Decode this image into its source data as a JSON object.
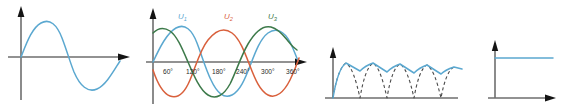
{
  "figure": {
    "background_color": "#ffffff",
    "axis_color": "#6e6e6e",
    "arrow_color": "#141414",
    "panel_count": 4
  },
  "palette": {
    "blue": "#5ba8d0",
    "red": "#d9603c",
    "green": "#3d7a4a",
    "dashed_gray": "#4a4a4a"
  },
  "panels": [
    {
      "id": "panel-ac-sine",
      "name": "single-phase-ac-sine",
      "description": "Single sinusoid, one full cycle, positive half then negative half",
      "axes": {
        "x_axis": true,
        "y_axis": true,
        "x_arrow": true,
        "y_arrow": true
      },
      "series": [
        {
          "name": "u",
          "color": "#5ba8d0",
          "style": "solid",
          "cycles": 1,
          "amplitude": 1.0
        }
      ],
      "tick_labels": []
    },
    {
      "id": "panel-three-phase",
      "name": "three-phase-ac-sines",
      "description": "Three sinusoids phase shifted by 120 degrees with degree axis labels",
      "axes": {
        "x_axis": true,
        "y_axis": true,
        "x_arrow": true,
        "y_arrow": true
      },
      "series": [
        {
          "name": "U1",
          "label": "U",
          "subscript": "1",
          "color": "#5ba8d0",
          "style": "solid",
          "phase_deg": 0
        },
        {
          "name": "U2",
          "label": "U",
          "subscript": "2",
          "color": "#d9603c",
          "style": "solid",
          "phase_deg": 120
        },
        {
          "name": "U3",
          "label": "U",
          "subscript": "3",
          "color": "#3d7a4a",
          "style": "solid",
          "phase_deg": 240
        }
      ],
      "tick_labels": [
        "60°",
        "120°",
        "180°",
        "240°",
        "300°",
        "360°"
      ],
      "tick_values_deg": [
        60,
        120,
        180,
        240,
        300,
        360
      ]
    },
    {
      "id": "panel-rectified-ripple",
      "name": "rectified-ripple-waveform",
      "description": "Dashed rectified sine pulses with solid blue smoothed ripple envelope decaying slightly",
      "axes": {
        "x_axis": true,
        "y_axis": true,
        "x_arrow": false,
        "y_arrow": true
      },
      "series": [
        {
          "name": "rectified-pulses",
          "color": "#4a4a4a",
          "style": "dashed",
          "pulse_count": 4
        },
        {
          "name": "ripple-envelope",
          "color": "#5ba8d0",
          "style": "solid",
          "ripple_count": 4
        }
      ],
      "tick_labels": []
    },
    {
      "id": "panel-dc-flat",
      "name": "smoothed-dc-output",
      "description": "Flat horizontal constant DC level line",
      "axes": {
        "x_axis": true,
        "y_axis": true,
        "x_arrow": true,
        "y_arrow": true
      },
      "series": [
        {
          "name": "Udc",
          "color": "#5ba8d0",
          "style": "solid",
          "level": 1.0
        }
      ],
      "tick_labels": []
    }
  ]
}
